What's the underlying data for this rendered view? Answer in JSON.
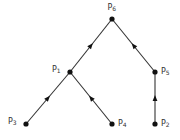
{
  "diagram": {
    "type": "tree",
    "nodes": [
      {
        "id": "P6",
        "base": "P",
        "sub": "6",
        "x": 112,
        "y": 19,
        "label_pos": "above"
      },
      {
        "id": "P1",
        "base": "P",
        "sub": "1",
        "x": 70,
        "y": 72,
        "label_pos": "left"
      },
      {
        "id": "P5",
        "base": "P",
        "sub": "5",
        "x": 155,
        "y": 72,
        "label_pos": "right"
      },
      {
        "id": "P3",
        "base": "P",
        "sub": "3",
        "x": 26,
        "y": 124,
        "label_pos": "left"
      },
      {
        "id": "P4",
        "base": "P",
        "sub": "4",
        "x": 112,
        "y": 124,
        "label_pos": "right"
      },
      {
        "id": "P2",
        "base": "P",
        "sub": "2",
        "x": 155,
        "y": 124,
        "label_pos": "right"
      }
    ],
    "edges": [
      {
        "from": "P3",
        "to": "P1",
        "arrow": "toward-parent"
      },
      {
        "from": "P4",
        "to": "P1",
        "arrow": "toward-parent"
      },
      {
        "from": "P1",
        "to": "P6",
        "arrow": "toward-parent"
      },
      {
        "from": "P2",
        "to": "P5",
        "arrow": "toward-parent"
      },
      {
        "from": "P5",
        "to": "P6",
        "arrow": "toward-parent"
      }
    ],
    "colors": {
      "line": "#333333",
      "node": "#111111",
      "label": "#333333"
    }
  }
}
